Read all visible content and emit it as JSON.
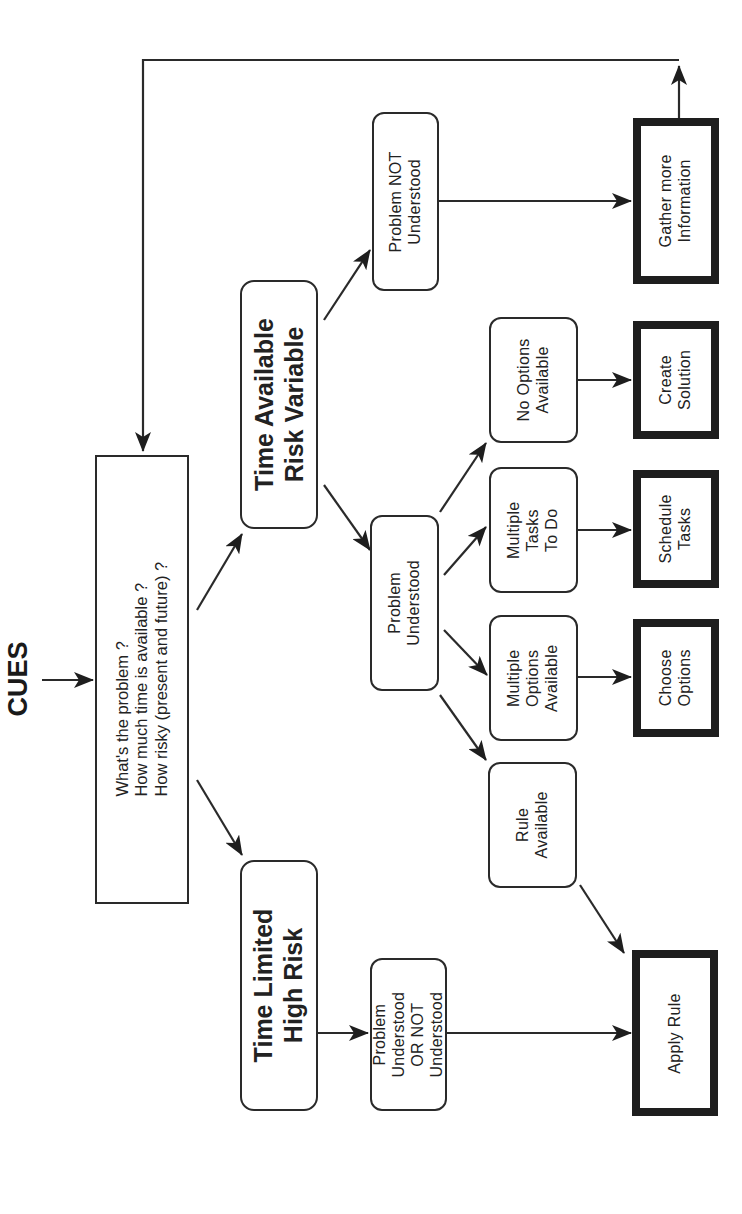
{
  "diagram": {
    "orientation": "rotated-90-ccw",
    "title": "CUES",
    "colors": {
      "line": "#2a2a2a",
      "background": "#ffffff",
      "text": "#222222"
    },
    "question_box": {
      "lines": "What's the problem ?\nHow much time is available ?\nHow risky (present and future) ?"
    },
    "branches": {
      "time_available": "Time Available\nRisk Variable",
      "time_limited": "Time Limited\nHigh Risk"
    },
    "conditions": {
      "problem_not_understood": "Problem NOT\nUnderstood",
      "problem_understood": "Problem\nUnderstood",
      "problem_either": "Problem\nUnderstood\nOR NOT\nUnderstood"
    },
    "situations": {
      "no_options": "No Options\nAvailable",
      "multiple_tasks": "Multiple\nTasks\nTo Do",
      "multiple_options": "Multiple\nOptions\nAvailable",
      "rule_available": "Rule\nAvailable"
    },
    "actions": {
      "gather_info": "Gather more\nInformation",
      "create_solution": "Create\nSolution",
      "schedule_tasks": "Schedule\nTasks",
      "choose_options": "Choose\nOptions",
      "apply_rule": "Apply Rule"
    },
    "edges": [
      {
        "from": "CUES",
        "to": "question_box"
      },
      {
        "from": "question_box",
        "to": "time_available"
      },
      {
        "from": "question_box",
        "to": "time_limited"
      },
      {
        "from": "time_available",
        "to": "problem_not_understood"
      },
      {
        "from": "time_available",
        "to": "problem_understood"
      },
      {
        "from": "time_limited",
        "to": "problem_either"
      },
      {
        "from": "problem_not_understood",
        "to": "gather_info"
      },
      {
        "from": "problem_understood",
        "to": "no_options"
      },
      {
        "from": "problem_understood",
        "to": "multiple_tasks"
      },
      {
        "from": "problem_understood",
        "to": "multiple_options"
      },
      {
        "from": "problem_understood",
        "to": "rule_available"
      },
      {
        "from": "no_options",
        "to": "create_solution"
      },
      {
        "from": "multiple_tasks",
        "to": "schedule_tasks"
      },
      {
        "from": "multiple_options",
        "to": "choose_options"
      },
      {
        "from": "rule_available",
        "to": "apply_rule"
      },
      {
        "from": "problem_either",
        "to": "apply_rule"
      },
      {
        "from": "gather_info",
        "to": "question_box",
        "type": "feedback-loop"
      }
    ]
  }
}
